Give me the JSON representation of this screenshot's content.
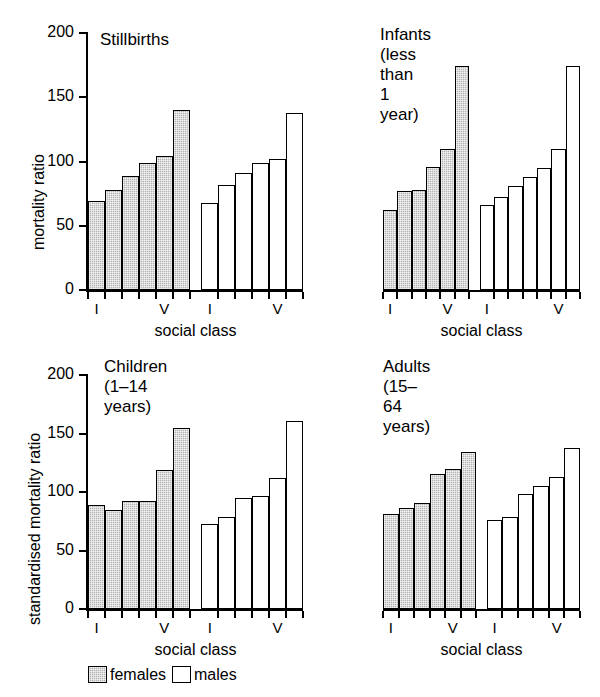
{
  "figure": {
    "background": "#ffffff",
    "ink": "#000000",
    "female_fill": "#b4b4b4",
    "male_fill": "#ffffff"
  },
  "legend": {
    "position": "bottom-left",
    "items": [
      {
        "key": "females",
        "label": "females",
        "swatch": "shaded"
      },
      {
        "key": "males",
        "label": "males",
        "swatch": "white"
      }
    ]
  },
  "chart_data": [
    {
      "type": "bar",
      "title": "Stillbirths",
      "xlabel": "social class",
      "ylabel": "mortality ratio",
      "ylim": [
        0,
        200
      ],
      "yticks": [
        0,
        50,
        100,
        150,
        200
      ],
      "grid": false,
      "categories": [
        "I",
        "II",
        "III",
        "IV",
        "V",
        "V+"
      ],
      "xtick_labels": [
        "I",
        "V",
        "I",
        "V"
      ],
      "series": [
        {
          "name": "females",
          "values": [
            69,
            78,
            89,
            99,
            104,
            140
          ]
        },
        {
          "name": "males",
          "values": [
            68,
            82,
            91,
            99,
            102,
            138
          ]
        }
      ]
    },
    {
      "type": "bar",
      "title": "Infants (less than\n1 year)",
      "xlabel": "social class",
      "ylabel": "mortality ratio",
      "ylim": [
        0,
        200
      ],
      "yticks": [
        0,
        50,
        100,
        150,
        200
      ],
      "grid": false,
      "categories": [
        "I",
        "II",
        "III",
        "IV",
        "V",
        "V+"
      ],
      "xtick_labels": [
        "I",
        "V",
        "I",
        "V"
      ],
      "series": [
        {
          "name": "females",
          "values": [
            62,
            77,
            78,
            96,
            110,
            174
          ]
        },
        {
          "name": "males",
          "values": [
            66,
            72,
            81,
            88,
            95,
            110,
            174
          ]
        }
      ]
    },
    {
      "type": "bar",
      "title": "Children (1–14 years)",
      "xlabel": "social class",
      "ylabel": "standardised mortality ratio",
      "ylim": [
        0,
        200
      ],
      "yticks": [
        0,
        50,
        100,
        150,
        200
      ],
      "grid": false,
      "categories": [
        "I",
        "II",
        "III",
        "IV",
        "V",
        "V+"
      ],
      "xtick_labels": [
        "I",
        "V",
        "I",
        "V"
      ],
      "series": [
        {
          "name": "females",
          "values": [
            89,
            85,
            92,
            92,
            119,
            155
          ]
        },
        {
          "name": "males",
          "values": [
            73,
            79,
            95,
            97,
            112,
            161
          ]
        }
      ]
    },
    {
      "type": "bar",
      "title": "Adults (15–64 years)",
      "xlabel": "social class",
      "ylabel": "standardised mortality ratio",
      "ylim": [
        0,
        200
      ],
      "yticks": [
        0,
        50,
        100,
        150,
        200
      ],
      "grid": false,
      "categories": [
        "I",
        "II",
        "III",
        "IV",
        "V",
        "V+"
      ],
      "xtick_labels": [
        "I",
        "V",
        "I",
        "V"
      ],
      "series": [
        {
          "name": "females",
          "values": [
            81,
            86,
            91,
            115,
            120,
            134
          ]
        },
        {
          "name": "males",
          "values": [
            76,
            79,
            98,
            105,
            113,
            138
          ]
        }
      ]
    }
  ]
}
